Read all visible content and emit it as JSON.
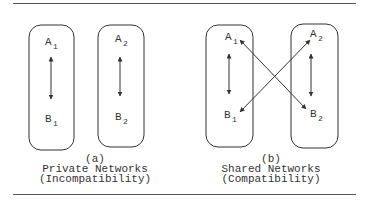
{
  "panels": [
    {
      "id": "a",
      "label": "(a)",
      "title": "Private Networks",
      "subtitle": "(Incompatibility)",
      "boxes": [
        {
          "top": {
            "letter": "A",
            "sub": "1"
          },
          "bottom": {
            "letter": "B",
            "sub": "1"
          }
        },
        {
          "top": {
            "letter": "A",
            "sub": "2"
          },
          "bottom": {
            "letter": "B",
            "sub": "2"
          }
        }
      ]
    },
    {
      "id": "b",
      "label": "(b)",
      "title": "Shared Networks",
      "subtitle": "(Compatibility)",
      "boxes": [
        {
          "top": {
            "letter": "A",
            "sub": "1"
          },
          "bottom": {
            "letter": "B",
            "sub": "1"
          }
        },
        {
          "top": {
            "letter": "A",
            "sub": "2"
          },
          "bottom": {
            "letter": "B",
            "sub": "2"
          }
        }
      ],
      "cross_links": [
        "A1-B2",
        "A2-B1"
      ]
    }
  ],
  "colors": {
    "stroke": "#333333",
    "rule": "#555555"
  }
}
